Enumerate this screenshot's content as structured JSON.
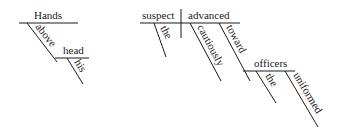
{
  "diagram": {
    "type": "sentence-diagram",
    "phrases": [
      {
        "id": "absolute",
        "head": "Hands",
        "modifiers": [
          {
            "word": "above",
            "modifies": "Hands"
          },
          {
            "word": "head",
            "object_of": "above"
          },
          {
            "word": "his",
            "modifies": "head"
          }
        ]
      },
      {
        "id": "main-clause",
        "subject": "suspect",
        "verb": "advanced",
        "subject_modifiers": [
          "the"
        ],
        "verb_modifiers": [
          "cautiously",
          "toward"
        ],
        "prepositional_object": "officers",
        "object_modifiers": [
          "the",
          "uniformed"
        ]
      }
    ],
    "labels": {
      "hands": "Hands",
      "above": "above",
      "head": "head",
      "his": "his",
      "suspect": "suspect",
      "advanced": "advanced",
      "the1": "the",
      "cautiously": "cautiously",
      "toward": "toward",
      "officers": "officers",
      "the2": "the",
      "uniformed": "uniformed"
    }
  }
}
